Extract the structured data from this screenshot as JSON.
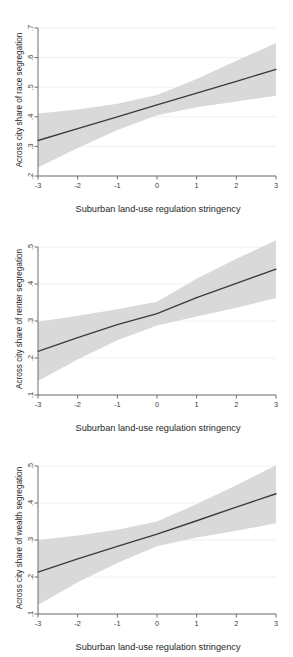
{
  "figure": {
    "width": 293,
    "height": 657,
    "background": "#ffffff",
    "band_color": "#d9d9d9",
    "line_color": "#3a3a3a",
    "axis_color": "#6e6e6e",
    "grid_color": "#f0f0f0",
    "panel_count": 3,
    "cropped_header_text": "    "
  },
  "chart_data": [
    {
      "type": "line",
      "title": "",
      "xlabel": "Suburban land-use regulation stringency",
      "ylabel": "Across city share of race segregation",
      "xlim": [
        -3,
        3
      ],
      "ylim": [
        0.2,
        0.7
      ],
      "xticks": [
        -3,
        -2,
        -1,
        0,
        1,
        2,
        3
      ],
      "xticklabels": [
        "-3",
        "-2",
        "-1",
        "0",
        "1",
        "2",
        "3"
      ],
      "yticks": [
        0.2,
        0.3,
        0.4,
        0.5,
        0.6,
        0.7
      ],
      "yticklabels": [
        ".2",
        ".3",
        ".4",
        ".5",
        ".6",
        ".7"
      ],
      "grid": "horizontal",
      "legend": "none",
      "x": [
        -3,
        -2,
        -1,
        0,
        1,
        2,
        3
      ],
      "fit": [
        0.32,
        0.36,
        0.4,
        0.44,
        0.48,
        0.52,
        0.56
      ],
      "ci_lower": [
        0.229,
        0.295,
        0.355,
        0.405,
        0.432,
        0.452,
        0.471
      ],
      "ci_upper": [
        0.411,
        0.425,
        0.444,
        0.474,
        0.528,
        0.589,
        0.649
      ]
    },
    {
      "type": "line",
      "title": "",
      "xlabel": "Suburban land-use regulation stringency",
      "ylabel": "Across city share of renter segregation",
      "xlim": [
        -3,
        3
      ],
      "ylim": [
        0.1,
        0.5
      ],
      "xticks": [
        -3,
        -2,
        -1,
        0,
        1,
        2,
        3
      ],
      "xticklabels": [
        "-3",
        "-2",
        "-1",
        "0",
        "1",
        "2",
        "3"
      ],
      "yticks": [
        0.1,
        0.2,
        0.3,
        0.4,
        0.5
      ],
      "yticklabels": [
        ".1",
        ".2",
        ".3",
        ".4",
        ".5"
      ],
      "grid": "horizontal",
      "legend": "none",
      "x": [
        -3,
        -2,
        -1,
        0,
        1,
        2,
        3
      ],
      "fit": [
        0.218,
        0.255,
        0.29,
        0.32,
        0.363,
        0.402,
        0.44
      ],
      "ci_lower": [
        0.138,
        0.196,
        0.248,
        0.288,
        0.312,
        0.336,
        0.362
      ],
      "ci_upper": [
        0.298,
        0.314,
        0.332,
        0.352,
        0.414,
        0.468,
        0.518
      ]
    },
    {
      "type": "line",
      "title": "",
      "xlabel": "Suburban land-use regulation stringency",
      "ylabel": "Across city share of wealth segregation",
      "xlim": [
        -3,
        3
      ],
      "ylim": [
        0.1,
        0.5
      ],
      "xticks": [
        -3,
        -2,
        -1,
        0,
        1,
        2,
        3
      ],
      "xticklabels": [
        "-3",
        "-2",
        "-1",
        "0",
        "1",
        "2",
        "3"
      ],
      "yticks": [
        0.1,
        0.2,
        0.3,
        0.4,
        0.5
      ],
      "yticklabels": [
        ".1",
        ".2",
        ".3",
        ".4",
        ".5"
      ],
      "grid": "horizontal",
      "legend": "none",
      "x": [
        -3,
        -2,
        -1,
        0,
        1,
        2,
        3
      ],
      "fit": [
        0.213,
        0.249,
        0.283,
        0.316,
        0.352,
        0.389,
        0.425
      ],
      "ci_lower": [
        0.124,
        0.186,
        0.238,
        0.283,
        0.307,
        0.325,
        0.345
      ],
      "ci_upper": [
        0.3,
        0.312,
        0.328,
        0.35,
        0.397,
        0.448,
        0.502
      ]
    }
  ]
}
